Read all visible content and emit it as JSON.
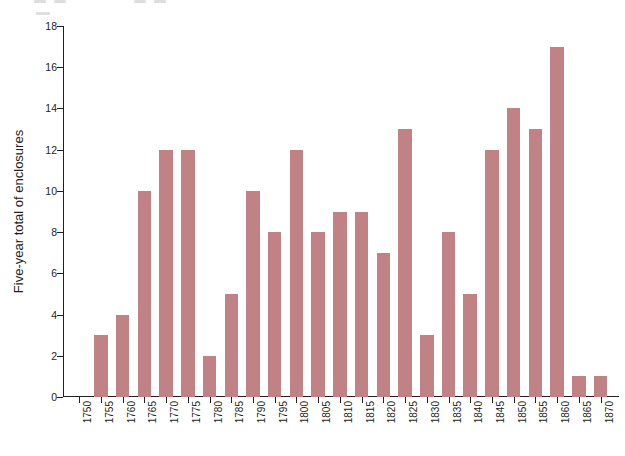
{
  "chart_data": {
    "type": "bar",
    "title": "",
    "subtitle": "",
    "xlabel": "",
    "ylabel": "Five-year total of enclosures",
    "categories": [
      "1750",
      "1755",
      "1760",
      "1765",
      "1770",
      "1775",
      "1780",
      "1785",
      "1790",
      "1795",
      "1800",
      "1805",
      "1810",
      "1815",
      "1820",
      "1825",
      "1830",
      "1835",
      "1840",
      "1845",
      "1850",
      "1855",
      "1860",
      "1865",
      "1870"
    ],
    "values": [
      0,
      3,
      4,
      10,
      12,
      12,
      2,
      5,
      10,
      8,
      12,
      8,
      9,
      9,
      7,
      13,
      3,
      8,
      5,
      12,
      14,
      13,
      17,
      1,
      1
    ],
    "ylim": [
      0,
      18
    ],
    "ytick_values": [
      0,
      2,
      4,
      6,
      8,
      10,
      12,
      14,
      16,
      18
    ],
    "ytick_labels": [
      "0",
      "2",
      "4",
      "6",
      "8",
      "10",
      "12",
      "14",
      "16",
      "18"
    ],
    "xtick_labels": [
      "1750",
      "1755",
      "1760",
      "1765",
      "1770",
      "1775",
      "1780",
      "1785",
      "1790",
      "1795",
      "1800",
      "1805",
      "1810",
      "1815",
      "1820",
      "1825",
      "1830",
      "1835",
      "1840",
      "1845",
      "1850",
      "1855",
      "1860",
      "1865",
      "1870"
    ],
    "grid": false,
    "legend": null,
    "legend_position": "none",
    "bar_color": "#c08284",
    "axis_color": "#231f20",
    "background_color": "#ffffff",
    "annotations": []
  }
}
